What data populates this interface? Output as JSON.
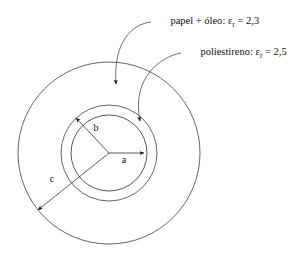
{
  "figure": {
    "background_color": "#ffffff",
    "stroke_color": "#555555"
  },
  "callouts": [
    {
      "name": "papel-oleo",
      "material": "papel + óleo",
      "separator": ": ",
      "symbol": "ε",
      "subscript": "r",
      "equals": " = ",
      "value": "2,3",
      "full_text": "papel + óleo: εr = 2,3"
    },
    {
      "name": "poliestireno",
      "material": "poliestireno",
      "separator": ": ",
      "symbol": "ε",
      "subscript": "r",
      "equals": " = ",
      "value": "2,5",
      "full_text": "poliestireno: εr = 2,5"
    }
  ],
  "dimensions": [
    {
      "name": "radius-a",
      "label": "a",
      "region": "inner conductor (hatched core)"
    },
    {
      "name": "radius-b",
      "label": "b",
      "region": "inner dielectric boundary"
    },
    {
      "name": "radius-c",
      "label": "c",
      "region": "outer dielectric boundary"
    }
  ],
  "geometry": {
    "center_x": 109,
    "center_y": 153,
    "radius_a": 38,
    "radius_b": 48,
    "radius_c": 91,
    "hatch_angle_deg": 45
  }
}
